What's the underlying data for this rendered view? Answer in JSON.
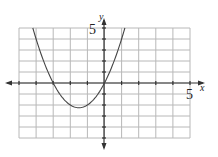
{
  "chart_data": {
    "type": "line",
    "title": "",
    "xlabel": "x",
    "ylabel": "y",
    "xlim": [
      -5,
      5
    ],
    "ylim": [
      -5,
      5
    ],
    "grid": true,
    "grid_step": 1,
    "tick_labels": {
      "x_max": "5",
      "y_max": "5"
    },
    "series": [
      {
        "name": "parabola",
        "equation": "y = x^2 + 3x",
        "vertex": [
          -1.5,
          -2.25
        ],
        "x_intercepts": [
          -3,
          0
        ],
        "x": [
          -4.19,
          -4,
          -3.5,
          -3,
          -2.5,
          -2,
          -1.5,
          -1,
          -0.5,
          0,
          0.5,
          1,
          1.19
        ],
        "y": [
          5,
          4,
          1.75,
          0,
          -1.25,
          -2,
          -2.25,
          -2,
          -1.25,
          0,
          1.75,
          4,
          5
        ]
      }
    ]
  },
  "labels": {
    "x_axis": "x",
    "y_axis": "y",
    "x_max": "5",
    "y_max": "5"
  },
  "colors": {
    "grid": "#b8b8b8",
    "axis": "#333333",
    "curve": "#444444"
  }
}
